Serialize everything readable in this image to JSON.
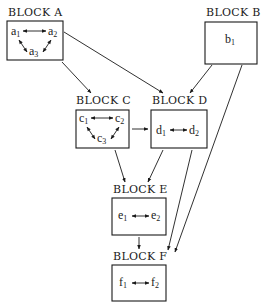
{
  "diagram": {
    "blocks": [
      {
        "id": "A",
        "label": "BLOCK A",
        "nodes": [
          {
            "base": "a",
            "sub": "1"
          },
          {
            "base": "a",
            "sub": "2"
          },
          {
            "base": "a",
            "sub": "3"
          }
        ],
        "internal_edges": [
          [
            "a1",
            "a2",
            "bidirectional"
          ],
          [
            "a1",
            "a3",
            "bidirectional"
          ],
          [
            "a2",
            "a3",
            "bidirectional"
          ]
        ]
      },
      {
        "id": "B",
        "label": "BLOCK B",
        "nodes": [
          {
            "base": "b",
            "sub": "1"
          }
        ],
        "internal_edges": []
      },
      {
        "id": "C",
        "label": "BLOCK C",
        "nodes": [
          {
            "base": "c",
            "sub": "1"
          },
          {
            "base": "c",
            "sub": "2"
          },
          {
            "base": "c",
            "sub": "3"
          }
        ],
        "internal_edges": [
          [
            "c1",
            "c2",
            "bidirectional"
          ],
          [
            "c1",
            "c3",
            "bidirectional"
          ],
          [
            "c2",
            "c3",
            "bidirectional"
          ]
        ]
      },
      {
        "id": "D",
        "label": "BLOCK D",
        "nodes": [
          {
            "base": "d",
            "sub": "1"
          },
          {
            "base": "d",
            "sub": "2"
          }
        ],
        "internal_edges": [
          [
            "d1",
            "d2",
            "bidirectional"
          ]
        ]
      },
      {
        "id": "E",
        "label": "BLOCK E",
        "nodes": [
          {
            "base": "e",
            "sub": "1"
          },
          {
            "base": "e",
            "sub": "2"
          }
        ],
        "internal_edges": [
          [
            "e1",
            "e2",
            "bidirectional"
          ]
        ]
      },
      {
        "id": "F",
        "label": "BLOCK F",
        "nodes": [
          {
            "base": "f",
            "sub": "1"
          },
          {
            "base": "f",
            "sub": "2"
          }
        ],
        "internal_edges": [
          [
            "f1",
            "f2",
            "bidirectional"
          ]
        ]
      }
    ],
    "block_edges": [
      {
        "from": "A",
        "to": "C"
      },
      {
        "from": "A",
        "to": "D"
      },
      {
        "from": "B",
        "to": "D"
      },
      {
        "from": "B",
        "to": "F"
      },
      {
        "from": "C",
        "to": "D"
      },
      {
        "from": "C",
        "to": "E"
      },
      {
        "from": "D",
        "to": "E"
      },
      {
        "from": "D",
        "to": "F"
      },
      {
        "from": "E",
        "to": "F"
      }
    ]
  }
}
